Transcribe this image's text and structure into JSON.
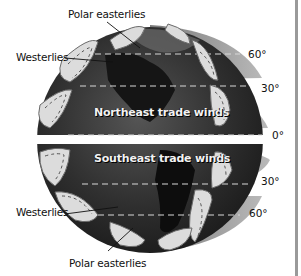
{
  "diagram": {
    "labels": {
      "polar_easterlies_north": "Polar easterlies",
      "westerlies_north": "Westerlies",
      "northeast_trade_winds": "Northeast trade winds",
      "southeast_trade_winds": "Southeast trade winds",
      "westerlies_south": "Westerlies",
      "polar_easterlies_south": "Polar easterlies"
    },
    "latitudes": {
      "north_60": "60°",
      "north_30": "30°",
      "equator": "0°",
      "south_30": "30°",
      "south_60": "60°"
    },
    "colors": {
      "globe": "#2e2e2e",
      "band_shade": "#8c8c8c",
      "cell_fill": "#dcdcdc",
      "text": "#111111",
      "border": "#9a9a9a"
    }
  }
}
